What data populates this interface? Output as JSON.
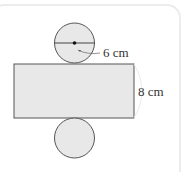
{
  "diagram": {
    "labels": {
      "diameter": "6 cm",
      "height": "8 cm"
    },
    "colors": {
      "fill": "#e8e8e8",
      "stroke": "#555555"
    }
  }
}
